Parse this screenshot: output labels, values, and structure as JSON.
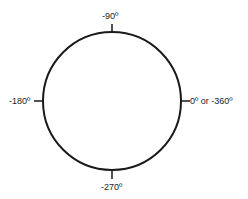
{
  "diagram": {
    "title": "",
    "type": "angle-circle",
    "stroke_color": "#1a1a1a",
    "background": "#ffffff",
    "labels": {
      "top": "-90º",
      "left": "-180º",
      "right": "0º or -360º",
      "bottom": "-270º"
    }
  }
}
